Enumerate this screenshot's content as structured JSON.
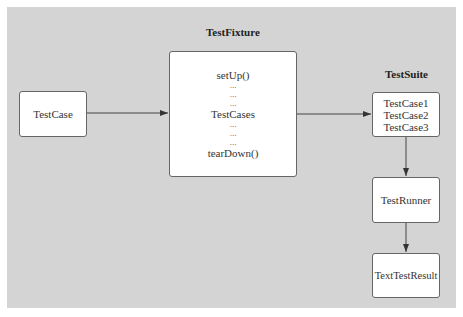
{
  "diagram": {
    "titles": {
      "fixture": "TestFixture",
      "suite": "TestSuite"
    },
    "nodes": {
      "testcase": {
        "label": "TestCase"
      },
      "fixture": {
        "lines": [
          "setUp()",
          "...",
          "...",
          "...",
          "TestCases",
          "...",
          "...",
          "...",
          "tearDown()"
        ]
      },
      "suite": {
        "lines": [
          "TestCase1",
          "TestCase2",
          "TestCase3"
        ]
      },
      "runner": {
        "label": "TestRunner"
      },
      "result": {
        "label": "TextTestResult"
      }
    },
    "edges": [
      {
        "from": "TestCase",
        "to": "TestFixture"
      },
      {
        "from": "TestFixture",
        "to": "TestSuite"
      },
      {
        "from": "TestSuite",
        "to": "TestRunner"
      },
      {
        "from": "TestRunner",
        "to": "TextTestResult"
      }
    ],
    "colors": {
      "background": "#d4d4d4",
      "box": "#ffffff",
      "border": "#666666"
    }
  }
}
